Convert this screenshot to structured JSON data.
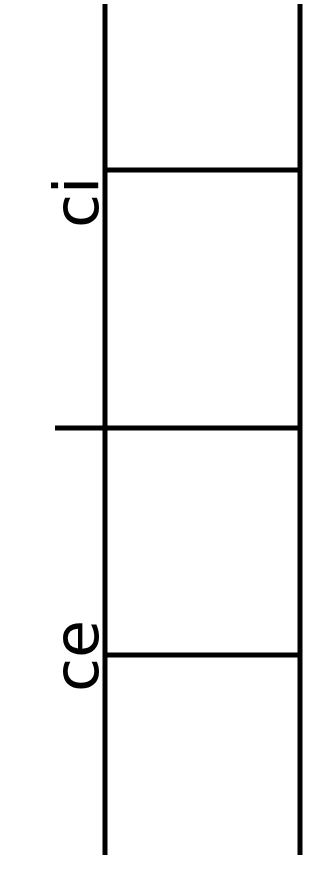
{
  "diagram": {
    "type": "ladder",
    "colors": {
      "line": "#000000",
      "background": "#ffffff"
    },
    "rails": [
      {
        "name": "left-rail",
        "x": 105,
        "y1": 4,
        "y2": 855
      },
      {
        "name": "right-rail",
        "x": 300,
        "y1": 4,
        "y2": 855
      }
    ],
    "rungs": [
      {
        "name": "rung-top",
        "y": 170,
        "x1": 105,
        "x2": 300
      },
      {
        "name": "rung-middle",
        "y": 428,
        "x1": 55,
        "x2": 300
      },
      {
        "name": "rung-bottom",
        "y": 655,
        "x1": 105,
        "x2": 300
      }
    ],
    "labels": [
      {
        "name": "label-ci",
        "text": "ci",
        "rotation": -90
      },
      {
        "name": "label-ce",
        "text": "ce",
        "rotation": -90
      }
    ]
  }
}
